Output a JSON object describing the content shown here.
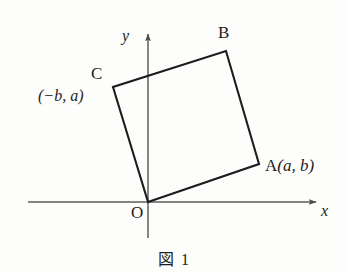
{
  "figure": {
    "caption_symbol": "図",
    "caption_number": "1",
    "background_color": "#fdfdfc",
    "axis_color": "#5a5a5a",
    "shape_color": "#1a1a1a"
  },
  "axes": {
    "x_label": "x",
    "y_label": "y",
    "origin_label": "O",
    "x_axis_start": [
      28,
      202
    ],
    "x_axis_end": [
      320,
      202
    ],
    "y_axis_start": [
      148,
      238
    ],
    "y_axis_end": [
      148,
      30
    ],
    "has_arrowheads": true
  },
  "shape": {
    "type": "square",
    "vertices": [
      {
        "name": "O",
        "label": "O",
        "x": 148,
        "y": 202
      },
      {
        "name": "A",
        "label": "A",
        "coords": "(a, b)",
        "x": 259,
        "y": 164
      },
      {
        "name": "B",
        "label": "B",
        "coords": "",
        "x": 226,
        "y": 51
      },
      {
        "name": "C",
        "label": "C",
        "coords": "(−b, a)",
        "x": 113,
        "y": 87
      }
    ]
  },
  "labels": {
    "vertex_a": "A",
    "vertex_a_coords": "(a, b)",
    "vertex_b": "B",
    "vertex_c": "C",
    "vertex_c_coords": "(−b, a)",
    "origin": "O",
    "axis_x": "x",
    "axis_y": "y"
  },
  "chart_data": {
    "type": "scatter",
    "xlabel": "x",
    "ylabel": "y",
    "grid": false,
    "legend": "none",
    "annotations": [
      {
        "text": "O",
        "role": "origin"
      },
      {
        "text": "A(a, b)",
        "role": "vertex-label"
      },
      {
        "text": "B",
        "role": "vertex-label"
      },
      {
        "text": "C",
        "role": "vertex-label"
      },
      {
        "text": "(−b, a)",
        "role": "vertex-coordinate"
      }
    ],
    "shapes": [
      {
        "kind": "polygon",
        "closed": true,
        "points_px": [
          [
            148,
            202
          ],
          [
            259,
            164
          ],
          [
            226,
            51
          ],
          [
            113,
            87
          ]
        ],
        "vertex_names": [
          "O",
          "A",
          "B",
          "C"
        ]
      }
    ]
  }
}
